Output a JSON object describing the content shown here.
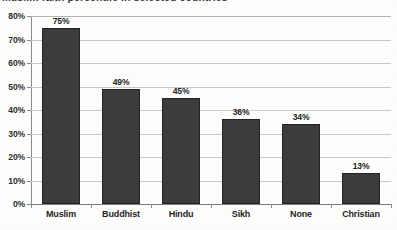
{
  "title": {
    "text": "Muslim faith percentile in selected countries",
    "clipped": true
  },
  "chart_data": {
    "type": "bar",
    "title": "Muslim faith percentile in selected countries",
    "xlabel": "",
    "ylabel": "",
    "categories": [
      "Muslim",
      "Buddhist",
      "Hindu",
      "Sikh",
      "None",
      "Christian"
    ],
    "values": [
      75,
      49,
      45,
      36,
      34,
      13
    ],
    "value_labels": [
      "75%",
      "49%",
      "45%",
      "36%",
      "34%",
      "13%"
    ],
    "ylim": [
      0,
      80
    ],
    "ytick_values": [
      0,
      10,
      20,
      30,
      40,
      50,
      60,
      70,
      80
    ],
    "ytick_labels": [
      "0%",
      "10%",
      "20%",
      "30%",
      "40%",
      "50%",
      "60%",
      "70%",
      "80%"
    ],
    "grid": true,
    "grid_axis": "y",
    "legend": false,
    "bar_color": "#3c3c3c",
    "grid_color": "#c9c9c9",
    "axis_color": "#8a8a8a",
    "background_color": "#fdfdfc"
  }
}
